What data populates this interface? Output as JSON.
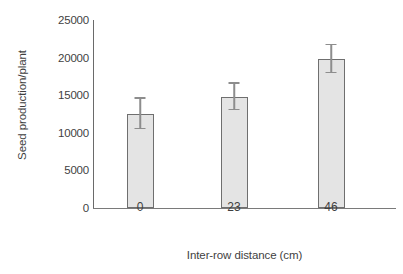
{
  "chart_data": {
    "type": "bar",
    "title": "",
    "subtitle": "",
    "xlabel": "Inter-row distance (cm)",
    "ylabel": "Seed production/plant",
    "categories": [
      "0",
      "23",
      "46"
    ],
    "values": [
      12500,
      14750,
      19800
    ],
    "errors": [
      2000,
      1750,
      1850
    ],
    "error_type": "symmetric",
    "ylim": [
      0,
      25000
    ],
    "yticks": [
      0,
      5000,
      10000,
      15000,
      20000,
      25000
    ],
    "ytick_labels": [
      "0",
      "5000",
      "10000",
      "15000",
      "20000",
      "25000"
    ],
    "xtick_labels": [
      "0",
      "23",
      "46"
    ],
    "grid": false,
    "legend": null,
    "legend_position": "none",
    "series": [
      {
        "name": "Seed production/plant",
        "values": [
          12500,
          14750,
          19800
        ],
        "errors": [
          2000,
          1750,
          1850
        ]
      }
    ],
    "colors": {
      "bar_fill": "#e4e4e4",
      "bar_edge": "#6f6f6f",
      "error_bar": "#8d8d8d",
      "axis": "#6a6a6a",
      "text": "#3f3f3f",
      "background": "#ffffff"
    }
  },
  "axes": {
    "y_ticks": [
      {
        "label": "25000",
        "value": 25000
      },
      {
        "label": "20000",
        "value": 20000
      },
      {
        "label": "15000",
        "value": 15000
      },
      {
        "label": "10000",
        "value": 10000
      },
      {
        "label": "5000",
        "value": 5000
      },
      {
        "label": "0",
        "value": 0
      }
    ],
    "x_ticks": [
      {
        "label": "0",
        "value": 0
      },
      {
        "label": "23",
        "value": 23
      },
      {
        "label": "46",
        "value": 46
      }
    ]
  }
}
